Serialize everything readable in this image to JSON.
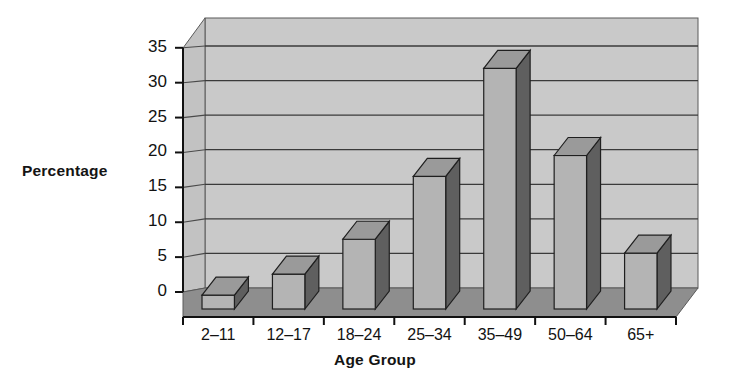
{
  "chart_data": {
    "type": "bar",
    "title": "",
    "subtitle": "",
    "xlabel": "Age Group",
    "ylabel": "Percentage",
    "categories": [
      "2–11",
      "12–17",
      "18–24",
      "25–34",
      "35–49",
      "50–64",
      "65+"
    ],
    "values": [
      2,
      5,
      10,
      19,
      34.5,
      22,
      8
    ],
    "series": [
      {
        "name": "Percentage",
        "values": [
          2,
          5,
          10,
          19,
          34.5,
          22,
          8
        ]
      }
    ],
    "ylim": [
      0,
      35
    ],
    "ytick_labels": [
      "0",
      "5",
      "10",
      "15",
      "20",
      "25",
      "30",
      "35"
    ],
    "ytick_values": [
      0,
      5,
      10,
      15,
      20,
      25,
      30,
      35
    ],
    "grid": "horizontal",
    "legend": "none",
    "style": "3d-column-grayscale",
    "colors": {
      "bar_front": "#b4b4b4",
      "bar_side": "#5f5f5f",
      "bar_top": "#9a9a9a",
      "back_wall": "#c9c9c9",
      "side_wall": "#c0c0c0",
      "floor": "#8e8e8e",
      "gridline": "#3a3a3a",
      "axis": "#111111",
      "text": "#121212"
    }
  }
}
